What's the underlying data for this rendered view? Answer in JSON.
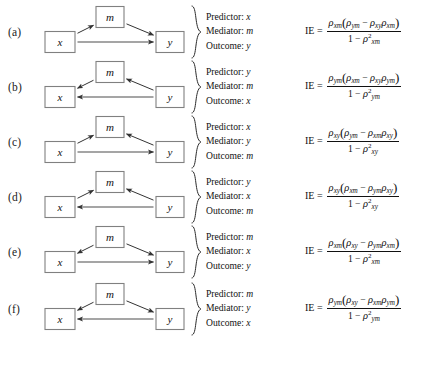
{
  "figure": {
    "caption_labels": [
      "(a)",
      "(b)",
      "(c)",
      "(d)",
      "(e)",
      "(f)"
    ],
    "node_names": {
      "x": "x",
      "m": "m",
      "y": "y"
    },
    "role_titles": {
      "predictor": "Predictor:",
      "mediator": "Mediator:",
      "outcome": "Outcome:"
    },
    "ie_label": "IE =",
    "rho_symbol": "ρ",
    "minus_symbol": "−",
    "one": "1",
    "square_exponent": "2"
  },
  "rows": [
    {
      "label": "(a)",
      "diagram": {
        "nodes": [
          {
            "name": "x",
            "text": "x"
          },
          {
            "name": "m",
            "text": "m"
          },
          {
            "name": "y",
            "text": "y"
          }
        ],
        "edges": [
          {
            "from": "x",
            "to": "m"
          },
          {
            "from": "m",
            "to": "y"
          },
          {
            "from": "x",
            "to": "y"
          }
        ]
      },
      "roles": {
        "predictor": "x",
        "mediator": "m",
        "outcome": "y"
      },
      "formula": {
        "lhs": "IE =",
        "numerator": {
          "outer_rho_sub": "xm",
          "first_rho_sub": "ym",
          "op": "−",
          "second_rho_sub": "xy",
          "third_rho_sub": "xm"
        },
        "denominator": {
          "one": "1",
          "op": "−",
          "rho_sub": "xm",
          "exponent": "2"
        },
        "plain": "IE = ρxm(ρym − ρxyρxm) / (1 − ρ²xm)"
      }
    },
    {
      "label": "(b)",
      "diagram": {
        "nodes": [
          {
            "name": "x",
            "text": "x"
          },
          {
            "name": "m",
            "text": "m"
          },
          {
            "name": "y",
            "text": "y"
          }
        ],
        "edges": [
          {
            "from": "y",
            "to": "m"
          },
          {
            "from": "m",
            "to": "x"
          },
          {
            "from": "y",
            "to": "x"
          }
        ]
      },
      "roles": {
        "predictor": "y",
        "mediator": "m",
        "outcome": "x"
      },
      "formula": {
        "lhs": "IE =",
        "numerator": {
          "outer_rho_sub": "ym",
          "first_rho_sub": "xm",
          "op": "−",
          "second_rho_sub": "xy",
          "third_rho_sub": "ym"
        },
        "denominator": {
          "one": "1",
          "op": "−",
          "rho_sub": "ym",
          "exponent": "2"
        },
        "plain": "IE = ρym(ρxm − ρxyρym) / (1 − ρ²ym)"
      }
    },
    {
      "label": "(c)",
      "diagram": {
        "nodes": [
          {
            "name": "x",
            "text": "x"
          },
          {
            "name": "m",
            "text": "m"
          },
          {
            "name": "y",
            "text": "y"
          }
        ],
        "edges": [
          {
            "from": "x",
            "to": "m"
          },
          {
            "from": "y",
            "to": "m"
          },
          {
            "from": "x",
            "to": "y"
          }
        ]
      },
      "roles": {
        "predictor": "x",
        "mediator": "y",
        "outcome": "m"
      },
      "formula": {
        "lhs": "IE =",
        "numerator": {
          "outer_rho_sub": "xy",
          "first_rho_sub": "ym",
          "op": "−",
          "second_rho_sub": "xm",
          "third_rho_sub": "xy"
        },
        "denominator": {
          "one": "1",
          "op": "−",
          "rho_sub": "xy",
          "exponent": "2"
        },
        "plain": "IE = ρxy(ρym − ρxmρxy) / (1 − ρ²xy)"
      }
    },
    {
      "label": "(d)",
      "diagram": {
        "nodes": [
          {
            "name": "x",
            "text": "x"
          },
          {
            "name": "m",
            "text": "m"
          },
          {
            "name": "y",
            "text": "y"
          }
        ],
        "edges": [
          {
            "from": "x",
            "to": "m"
          },
          {
            "from": "y",
            "to": "m"
          },
          {
            "from": "y",
            "to": "x"
          }
        ]
      },
      "roles": {
        "predictor": "y",
        "mediator": "x",
        "outcome": "m"
      },
      "formula": {
        "lhs": "IE =",
        "numerator": {
          "outer_rho_sub": "xy",
          "first_rho_sub": "xm",
          "op": "−",
          "second_rho_sub": "ym",
          "third_rho_sub": "xy"
        },
        "denominator": {
          "one": "1",
          "op": "−",
          "rho_sub": "xy",
          "exponent": "2"
        },
        "plain": "IE = ρxy(ρxm − ρymρxy) / (1 − ρ²xy)"
      }
    },
    {
      "label": "(e)",
      "diagram": {
        "nodes": [
          {
            "name": "x",
            "text": "x"
          },
          {
            "name": "m",
            "text": "m"
          },
          {
            "name": "y",
            "text": "y"
          }
        ],
        "edges": [
          {
            "from": "m",
            "to": "x"
          },
          {
            "from": "m",
            "to": "y"
          },
          {
            "from": "x",
            "to": "y"
          }
        ]
      },
      "roles": {
        "predictor": "m",
        "mediator": "x",
        "outcome": "y"
      },
      "formula": {
        "lhs": "IE =",
        "numerator": {
          "outer_rho_sub": "xm",
          "first_rho_sub": "xy",
          "op": "−",
          "second_rho_sub": "ym",
          "third_rho_sub": "xm"
        },
        "denominator": {
          "one": "1",
          "op": "−",
          "rho_sub": "xm",
          "exponent": "2"
        },
        "plain": "IE = ρxm(ρxy − ρymρxm) / (1 − ρ²xm)"
      }
    },
    {
      "label": "(f)",
      "diagram": {
        "nodes": [
          {
            "name": "x",
            "text": "x"
          },
          {
            "name": "m",
            "text": "m"
          },
          {
            "name": "y",
            "text": "y"
          }
        ],
        "edges": [
          {
            "from": "m",
            "to": "x"
          },
          {
            "from": "m",
            "to": "y"
          },
          {
            "from": "y",
            "to": "x"
          }
        ]
      },
      "roles": {
        "predictor": "m",
        "mediator": "y",
        "outcome": "x"
      },
      "formula": {
        "lhs": "IE =",
        "numerator": {
          "outer_rho_sub": "ym",
          "first_rho_sub": "xy",
          "op": "−",
          "second_rho_sub": "xm",
          "third_rho_sub": "ym"
        },
        "denominator": {
          "one": "1",
          "op": "−",
          "rho_sub": "ym",
          "exponent": "2"
        },
        "plain": "IE = ρym(ρxy − ρxmρym) / (1 − ρ²ym)"
      }
    }
  ],
  "colors": {
    "box_stroke": "#808080",
    "arrow_stroke": "#4d4d4d",
    "arrow_stroke_dark": "#333333",
    "text": "#111111",
    "background": "#ffffff"
  }
}
